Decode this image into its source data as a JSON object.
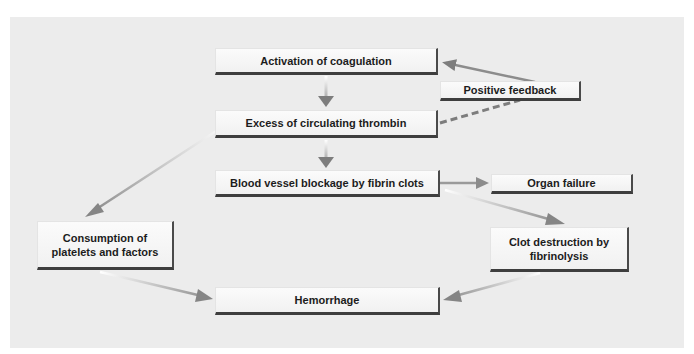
{
  "diagram": {
    "nodes": [
      {
        "id": "activation",
        "label": "Activation of coagulation"
      },
      {
        "id": "positive_feedback",
        "label": "Positive feedback"
      },
      {
        "id": "excess_thrombin",
        "label": "Excess of circulating thrombin"
      },
      {
        "id": "blockage",
        "label": "Blood vessel blockage by fibrin clots"
      },
      {
        "id": "organ_failure",
        "label": "Organ failure"
      },
      {
        "id": "consumption",
        "label": "Consumption of platelets and factors"
      },
      {
        "id": "clot_destruction",
        "label": "Clot destruction by fibrinolysis"
      },
      {
        "id": "hemorrhage",
        "label": "Hemorrhage"
      }
    ],
    "edges": [
      {
        "from": "activation",
        "to": "excess_thrombin",
        "style": "solid"
      },
      {
        "from": "excess_thrombin",
        "to": "blockage",
        "style": "solid"
      },
      {
        "from": "excess_thrombin",
        "to": "positive_feedback",
        "style": "dashed"
      },
      {
        "from": "positive_feedback",
        "to": "activation",
        "style": "solid"
      },
      {
        "from": "blockage",
        "to": "organ_failure",
        "style": "solid"
      },
      {
        "from": "blockage",
        "to": "clot_destruction",
        "style": "solid"
      },
      {
        "from": "excess_thrombin",
        "to": "consumption",
        "style": "solid"
      },
      {
        "from": "consumption",
        "to": "hemorrhage",
        "style": "solid"
      },
      {
        "from": "clot_destruction",
        "to": "hemorrhage",
        "style": "solid"
      }
    ]
  },
  "labels": {
    "activation": "Activation of coagulation",
    "positive_feedback": "Positive feedback",
    "excess_thrombin": "Excess of circulating thrombin",
    "blockage": "Blood vessel blockage by fibrin clots",
    "organ_failure": "Organ failure",
    "consumption_line1": "Consumption of",
    "consumption_line2": "platelets and factors",
    "clot_line1": "Clot destruction by",
    "clot_line2": "fibrinolysis",
    "hemorrhage": "Hemorrhage"
  },
  "colors": {
    "panel": "#ececec",
    "arrow": "#7a7a7a",
    "box_shadow": "#3e3e3e"
  }
}
